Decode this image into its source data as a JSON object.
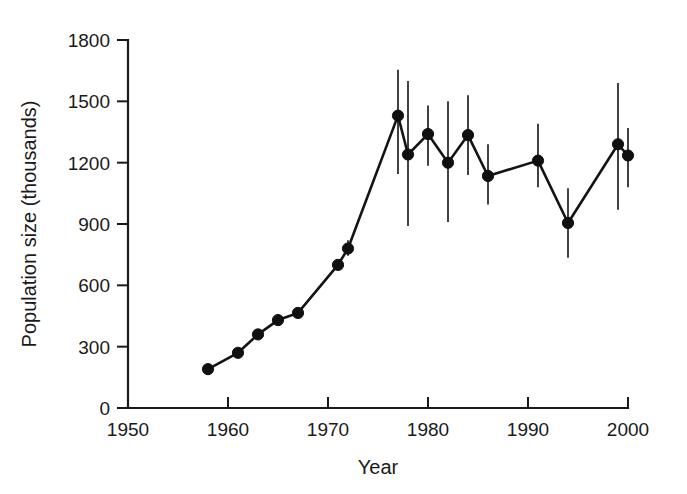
{
  "chart_data": {
    "type": "line",
    "title": "",
    "xlabel": "Year",
    "ylabel": "Population size (thousands)",
    "xlim": [
      1950,
      2000
    ],
    "ylim": [
      0,
      1800
    ],
    "xticks": [
      1950,
      1960,
      1970,
      1980,
      1990,
      2000
    ],
    "yticks": [
      0,
      300,
      600,
      900,
      1200,
      1500,
      1800
    ],
    "xtick_labels": [
      "1950",
      "1960",
      "1970",
      "1980",
      "1990",
      "2000"
    ],
    "ytick_labels": [
      "0",
      "300",
      "600",
      "900",
      "1200",
      "1500",
      "1800"
    ],
    "grid": false,
    "legend": "none",
    "marker": "filled-circle",
    "errorbars": "vertical-lines-no-caps",
    "series": [
      {
        "name": "Population size",
        "x": [
          1958,
          1961,
          1963,
          1965,
          1967,
          1971,
          1972,
          1977,
          1978,
          1980,
          1982,
          1984,
          1986,
          1991,
          1994,
          1999,
          2000
        ],
        "values": [
          190,
          270,
          360,
          430,
          465,
          700,
          780,
          1430,
          1240,
          1340,
          1200,
          1335,
          1135,
          1210,
          905,
          1290,
          1235
        ],
        "err_low": [
          null,
          null,
          null,
          null,
          null,
          685,
          745,
          1145,
          890,
          1185,
          910,
          1140,
          995,
          1080,
          735,
          970,
          1080
        ],
        "err_high": [
          null,
          null,
          null,
          null,
          null,
          715,
          820,
          1655,
          1600,
          1480,
          1500,
          1530,
          1290,
          1390,
          1075,
          1590,
          1370
        ]
      }
    ]
  },
  "axes": {
    "x_axis_name": "year-axis",
    "y_axis_name": "population-axis"
  }
}
